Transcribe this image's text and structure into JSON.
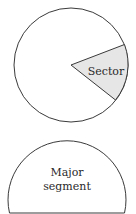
{
  "diagrams": {
    "sector": {
      "label": "Sector",
      "fill": "#e6e6e6",
      "stroke": "#3a3a3a"
    },
    "major_segment": {
      "label_line1": "Major",
      "label_line2": "segment",
      "stroke": "#3a3a3a"
    }
  }
}
